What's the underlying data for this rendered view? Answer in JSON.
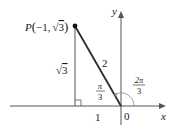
{
  "diagram": {
    "point": {
      "name": "P",
      "coords_text": "(−1, √3)",
      "open": "(",
      "x": "−1,",
      "sqrt": "√",
      "y": "3",
      "close": ")"
    },
    "sides": {
      "hypotenuse": "2",
      "vertical_sqrt": "√",
      "vertical": "3",
      "horizontal": "1"
    },
    "angles": {
      "reference_num": "π",
      "reference_den": "3",
      "standard_num": "2π",
      "standard_den": "3"
    },
    "axes": {
      "x_label": "x",
      "y_label": "y",
      "origin_label": "0"
    },
    "colors": {
      "hypotenuse": "#2b2b2b",
      "lines": "#555555",
      "arc": "#888888"
    }
  }
}
